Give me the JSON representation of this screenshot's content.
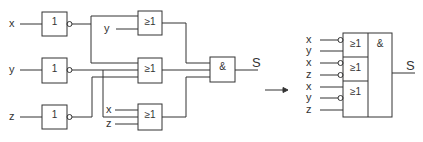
{
  "diagram": {
    "type": "logic-circuit",
    "colors": {
      "line": "#333333",
      "background": "#ffffff"
    },
    "left_circuit": {
      "inputs": [
        "x",
        "y",
        "z"
      ],
      "not_gates": [
        {
          "id": "not-x",
          "symbol": "1",
          "input": "x"
        },
        {
          "id": "not-y",
          "symbol": "1",
          "input": "y"
        },
        {
          "id": "not-z",
          "symbol": "1",
          "input": "z"
        }
      ],
      "or_gates": [
        {
          "id": "or1",
          "symbol": "≥1",
          "inputs": [
            "¬x",
            "y"
          ],
          "input_labels": [
            "y"
          ]
        },
        {
          "id": "or2",
          "symbol": "≥1",
          "inputs": [
            "¬x",
            "¬y",
            "¬z"
          ]
        },
        {
          "id": "or3",
          "symbol": "≥1",
          "inputs": [
            "x",
            "¬y",
            "z"
          ],
          "input_labels": [
            "x",
            "z"
          ]
        }
      ],
      "and_gate": {
        "id": "and",
        "symbol": "&",
        "inputs": [
          "or1",
          "or2",
          "or3"
        ]
      },
      "output": "S"
    },
    "arrow": "→",
    "right_circuit": {
      "or_sections": [
        {
          "symbol": "≥1",
          "inputs": [
            {
              "label": "x",
              "inverted": true
            },
            {
              "label": "y",
              "inverted": false
            }
          ]
        },
        {
          "symbol": "≥1",
          "inputs": [
            {
              "label": "x",
              "inverted": true
            },
            {
              "label": "z",
              "inverted": true
            }
          ]
        },
        {
          "symbol": "≥1",
          "inputs": [
            {
              "label": "x",
              "inverted": false
            },
            {
              "label": "y",
              "inverted": true
            },
            {
              "label": "z",
              "inverted": false
            }
          ]
        }
      ],
      "and_symbol": "&",
      "output": "S"
    }
  }
}
